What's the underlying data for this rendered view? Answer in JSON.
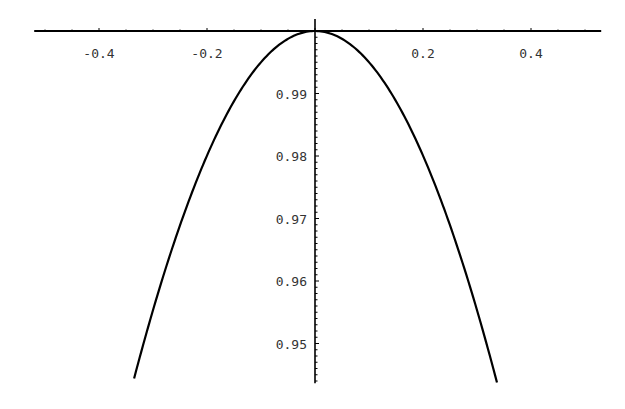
{
  "chart_data": {
    "type": "line",
    "title": "",
    "xlabel": "",
    "ylabel": "",
    "function": "cos(x)",
    "xlim": [
      -0.52,
      0.53
    ],
    "ylim": [
      0.944,
      1.0
    ],
    "x_ticks": [
      -0.4,
      -0.2,
      0.2,
      0.4
    ],
    "x_tick_labels": [
      "-0.4",
      "-0.2",
      "0.2",
      "0.4"
    ],
    "y_ticks": [
      0.99,
      0.98,
      0.97,
      0.96,
      0.95
    ],
    "y_tick_labels": [
      "0.99",
      "0.98",
      "0.97",
      "0.96",
      "0.95"
    ],
    "axes_origin": [
      0,
      1.0
    ],
    "grid": false,
    "legend": null,
    "series": [
      {
        "name": "cos(x)",
        "x": [
          -0.335,
          -0.3,
          -0.25,
          -0.2,
          -0.15,
          -0.1,
          -0.05,
          0,
          0.05,
          0.1,
          0.15,
          0.2,
          0.25,
          0.3,
          0.337
        ],
        "y": [
          0.9444,
          0.9553,
          0.9689,
          0.9801,
          0.9888,
          0.995,
          0.9988,
          1.0,
          0.9988,
          0.995,
          0.9888,
          0.9801,
          0.9689,
          0.9553,
          0.9438
        ]
      }
    ],
    "color": "#000000"
  }
}
